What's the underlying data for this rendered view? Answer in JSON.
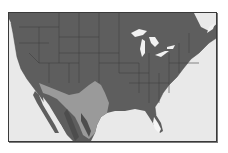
{
  "map": {
    "title": "",
    "region": "United States and northern Mexico",
    "colors": {
      "ocean": "#e9e9e9",
      "land": "#5e5e5e",
      "state_border": "#3f3f3f",
      "range_highlight": "#9a9a9a",
      "range_dark": "#4d4d4d",
      "lakes": "#f2f2f2",
      "florida_tip": "#f5f5f5",
      "frame": "#3a3a3a"
    },
    "legend": []
  }
}
